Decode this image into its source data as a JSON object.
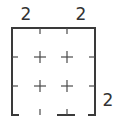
{
  "puzzle": {
    "grid_size": {
      "rows": 3,
      "cols": 3
    },
    "top_clues": [
      "2",
      "",
      "2"
    ],
    "right_clues": [
      "",
      "",
      "2"
    ],
    "colors": {
      "line": "#3a3a3a",
      "clue": "#333333",
      "background": "#ffffff"
    }
  }
}
